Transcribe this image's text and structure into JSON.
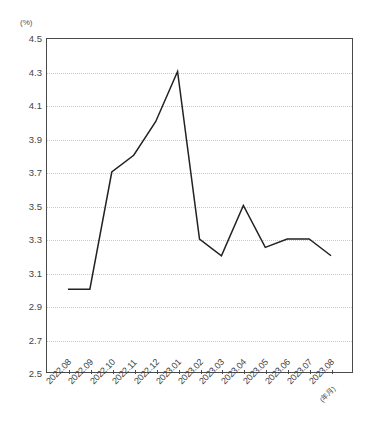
{
  "chart_data": {
    "type": "line",
    "title": "",
    "subtitle": "",
    "xlabel": "(年月)",
    "ylabel": "(%)",
    "unit_label": "(%)",
    "x_axis_unit_note": "(年月)",
    "categories": [
      "2022.08",
      "2022.09",
      "2022.10",
      "2022.11",
      "2022.12",
      "2023.01",
      "2023.02",
      "2023.03",
      "2023.04",
      "2023.05",
      "2023.06",
      "2023.07",
      "2023.08"
    ],
    "values": [
      3.0,
      3.0,
      3.7,
      3.8,
      4.0,
      4.3,
      3.3,
      3.2,
      3.5,
      3.25,
      3.3,
      3.3,
      3.2
    ],
    "series": [
      {
        "name": "",
        "color": "#222222",
        "values": [
          3.0,
          3.0,
          3.7,
          3.8,
          4.0,
          4.3,
          3.3,
          3.2,
          3.5,
          3.25,
          3.3,
          3.3,
          3.2
        ]
      }
    ],
    "ylim": [
      2.5,
      4.5
    ],
    "ytick_step": 0.2,
    "ytick_labels": [
      "4.5",
      "4.3",
      "4.1",
      "3.9",
      "3.7",
      "3.5",
      "3.3",
      "3.1",
      "2.9",
      "2.7",
      "2.5"
    ],
    "ytick_values": [
      4.5,
      4.3,
      4.1,
      3.9,
      3.7,
      3.5,
      3.3,
      3.1,
      2.9,
      2.7,
      2.5
    ],
    "grid": true,
    "grid_style": "dotted",
    "grid_color": "#c9c9c9",
    "legend": false,
    "legend_position": "none",
    "markers": false,
    "axis_color": "#4a4a4a",
    "background_color": "#ffffff"
  }
}
